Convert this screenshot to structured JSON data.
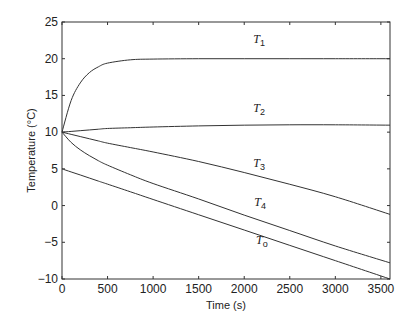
{
  "chart_data": {
    "type": "line",
    "title": "",
    "xlabel": "Time (s)",
    "ylabel": "Temperature (°C)",
    "xlim": [
      0,
      3600
    ],
    "ylim": [
      -10,
      25
    ],
    "xticks": [
      0,
      500,
      1000,
      1500,
      2000,
      2500,
      3000,
      3500
    ],
    "yticks": [
      -10,
      -5,
      0,
      5,
      10,
      15,
      20,
      25
    ],
    "grid": false,
    "legend": "inline labels",
    "x": [
      0,
      100,
      200,
      300,
      400,
      500,
      750,
      1000,
      1500,
      2000,
      2500,
      3000,
      3600
    ],
    "series": [
      {
        "name": "T1",
        "label_main": "T",
        "label_sub": "1",
        "values": [
          10,
          14.3,
          16.7,
          18.1,
          18.9,
          19.4,
          19.85,
          19.95,
          20,
          20,
          20,
          20,
          20
        ]
      },
      {
        "name": "T2",
        "label_main": "T",
        "label_sub": "2",
        "values": [
          10,
          10.1,
          10.2,
          10.3,
          10.4,
          10.5,
          10.6,
          10.7,
          10.85,
          10.95,
          11.0,
          11.0,
          10.95
        ]
      },
      {
        "name": "T3",
        "label_main": "T",
        "label_sub": "3",
        "values": [
          10,
          9.7,
          9.4,
          9.1,
          8.8,
          8.5,
          7.9,
          7.3,
          6.0,
          4.5,
          2.9,
          1.2,
          -1.2
        ]
      },
      {
        "name": "T4",
        "label_main": "T",
        "label_sub": "4",
        "values": [
          10,
          8.6,
          7.6,
          6.8,
          6.1,
          5.5,
          4.2,
          3.0,
          0.9,
          -1.3,
          -3.4,
          -5.5,
          -7.8
        ]
      },
      {
        "name": "To",
        "label_main": "T",
        "label_sub": "o",
        "values": [
          5,
          4.58,
          4.17,
          3.75,
          3.33,
          2.92,
          1.88,
          0.83,
          -1.25,
          -3.33,
          -5.42,
          -7.5,
          -10
        ]
      }
    ],
    "label_positions": [
      {
        "x": 2100,
        "y": 22.2
      },
      {
        "x": 2100,
        "y": 12.8
      },
      {
        "x": 2100,
        "y": 5.2
      },
      {
        "x": 2110,
        "y": 0
      },
      {
        "x": 2130,
        "y": -5.3
      }
    ]
  }
}
